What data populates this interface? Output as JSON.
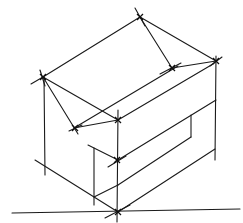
{
  "title": "Isometric box sketch",
  "colors": {
    "ink": "#1a1a1a",
    "background": "#ffffff"
  },
  "lines": [
    {
      "name": "ground-line",
      "x1": 12,
      "y1": 213,
      "x2": 240,
      "y2": 209
    },
    {
      "name": "top-left-edge",
      "x1": 43,
      "y1": 77,
      "x2": 140,
      "y2": 17
    },
    {
      "name": "top-left-edge-ext",
      "x1": 31,
      "y1": 84,
      "x2": 43,
      "y2": 77
    },
    {
      "name": "top-right-edge",
      "x1": 140,
      "y1": 17,
      "x2": 216,
      "y2": 61
    },
    {
      "name": "top-vertex-tick",
      "x1": 135,
      "y1": 8,
      "x2": 145,
      "y2": 26
    },
    {
      "name": "top-ridge-far",
      "x1": 140,
      "y1": 17,
      "x2": 172,
      "y2": 68
    },
    {
      "name": "top-ridge-right",
      "x1": 172,
      "y1": 68,
      "x2": 216,
      "y2": 61
    },
    {
      "name": "ridge-tick",
      "x1": 160,
      "y1": 74,
      "x2": 181,
      "y2": 63
    },
    {
      "name": "left-vertex-tick",
      "x1": 40,
      "y1": 70,
      "x2": 45,
      "y2": 86
    },
    {
      "name": "left-to-front-edge",
      "x1": 43,
      "y1": 77,
      "x2": 118,
      "y2": 120
    },
    {
      "name": "left-to-ridge-near",
      "x1": 43,
      "y1": 77,
      "x2": 78,
      "y2": 134
    },
    {
      "name": "ridge-near-to-front",
      "x1": 74,
      "y1": 128,
      "x2": 118,
      "y2": 120
    },
    {
      "name": "ridge-near-tick",
      "x1": 69,
      "y1": 131,
      "x2": 82,
      "y2": 125
    },
    {
      "name": "ridge-long-upper",
      "x1": 74,
      "y1": 128,
      "x2": 178,
      "y2": 66
    },
    {
      "name": "front-to-right-top",
      "x1": 118,
      "y1": 120,
      "x2": 213,
      "y2": 64
    },
    {
      "name": "left-vertical",
      "x1": 44,
      "y1": 77,
      "x2": 45,
      "y2": 175
    },
    {
      "name": "front-vertical",
      "x1": 118,
      "y1": 110,
      "x2": 117,
      "y2": 222
    },
    {
      "name": "right-vertical",
      "x1": 216,
      "y1": 56,
      "x2": 215,
      "y2": 160
    },
    {
      "name": "right-vertex-tick",
      "x1": 210,
      "y1": 66,
      "x2": 222,
      "y2": 57
    },
    {
      "name": "front-right-upper",
      "x1": 118,
      "y1": 160,
      "x2": 216,
      "y2": 100
    },
    {
      "name": "slot-right-vertical",
      "x1": 191,
      "y1": 115,
      "x2": 191,
      "y2": 137
    },
    {
      "name": "slot-bottom",
      "x1": 118,
      "y1": 185,
      "x2": 191,
      "y2": 137
    },
    {
      "name": "slot-bottom-ext",
      "x1": 94,
      "y1": 197,
      "x2": 118,
      "y2": 185
    },
    {
      "name": "front-right-base",
      "x1": 118,
      "y1": 212,
      "x2": 215,
      "y2": 149
    },
    {
      "name": "left-base-edge",
      "x1": 35,
      "y1": 160,
      "x2": 118,
      "y2": 212
    },
    {
      "name": "inner-notch-top",
      "x1": 88,
      "y1": 145,
      "x2": 118,
      "y2": 160
    },
    {
      "name": "inner-notch-vertical",
      "x1": 94,
      "y1": 148,
      "x2": 94,
      "y2": 205
    },
    {
      "name": "front-mid-tick",
      "x1": 108,
      "y1": 167,
      "x2": 126,
      "y2": 156
    },
    {
      "name": "front-base-tick",
      "x1": 105,
      "y1": 218,
      "x2": 130,
      "y2": 205
    }
  ],
  "vertices": [
    {
      "name": "top-vertex",
      "x": 140,
      "y": 17
    },
    {
      "name": "right-vertex",
      "x": 216,
      "y": 61
    },
    {
      "name": "left-vertex",
      "x": 43,
      "y": 77
    },
    {
      "name": "ridge-right-vertex",
      "x": 172,
      "y": 68
    },
    {
      "name": "front-top-vertex",
      "x": 118,
      "y": 120
    },
    {
      "name": "ridge-near-vertex",
      "x": 75,
      "y": 128
    },
    {
      "name": "front-mid-vertex",
      "x": 117,
      "y": 160
    },
    {
      "name": "front-base-vertex",
      "x": 118,
      "y": 212
    }
  ]
}
